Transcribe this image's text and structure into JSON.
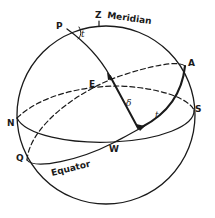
{
  "diagram": {
    "type": "celestial-sphere",
    "colors": {
      "ink": "#1a1a1a",
      "background": "#ffffff"
    },
    "points": {
      "zenith": "Z",
      "pole": "P",
      "equator_high_point": "A",
      "south": "S",
      "north": "N",
      "equator_low_point": "Q",
      "east": "E",
      "west": "W"
    },
    "curve_labels": {
      "meridian": "Meridian",
      "equator": "Equator"
    },
    "angle_labels": {
      "hour_angle_at_pole": "t",
      "hour_angle_on_equator": "t",
      "declination": "δ"
    }
  }
}
